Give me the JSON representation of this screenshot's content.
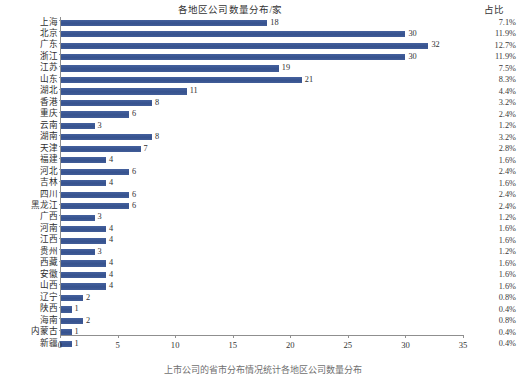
{
  "chart_data": {
    "type": "bar",
    "orientation": "horizontal",
    "title": "各地区公司数量分布/家",
    "xlabel": "",
    "ylabel": "",
    "xlim": [
      0,
      35
    ],
    "xticks": [
      0,
      5,
      10,
      15,
      20,
      25,
      30,
      35
    ],
    "grid": false,
    "legend": null,
    "bar_color": "#3c5896",
    "categories": [
      "上海",
      "北京",
      "广东",
      "浙江",
      "江苏",
      "山东",
      "湖北",
      "香港",
      "重庆",
      "云南",
      "湖南",
      "天津",
      "福建",
      "河北",
      "吉林",
      "四川",
      "黑龙江",
      "广西",
      "河南",
      "江西",
      "贵州",
      "西藏",
      "安徽",
      "山西",
      "辽宁",
      "陕西",
      "海南",
      "内蒙古",
      "新疆"
    ],
    "values": [
      18,
      30,
      32,
      30,
      19,
      21,
      11,
      8,
      6,
      3,
      8,
      7,
      4,
      6,
      4,
      6,
      6,
      3,
      4,
      4,
      3,
      4,
      4,
      4,
      2,
      1,
      2,
      1,
      1
    ],
    "percent_header": "占比",
    "percents": [
      "7.1%",
      "11.9%",
      "12.7%",
      "11.9%",
      "7.5%",
      "8.3%",
      "4.4%",
      "3.2%",
      "2.4%",
      "1.2%",
      "3.2%",
      "2.8%",
      "1.6%",
      "2.4%",
      "1.6%",
      "2.4%",
      "2.4%",
      "1.2%",
      "1.6%",
      "1.6%",
      "1.2%",
      "1.6%",
      "1.6%",
      "1.6%",
      "0.8%",
      "0.4%",
      "0.8%",
      "0.4%",
      "0.4%"
    ]
  },
  "caption": "上市公司的省市分布情况统计各地区公司数量分布"
}
